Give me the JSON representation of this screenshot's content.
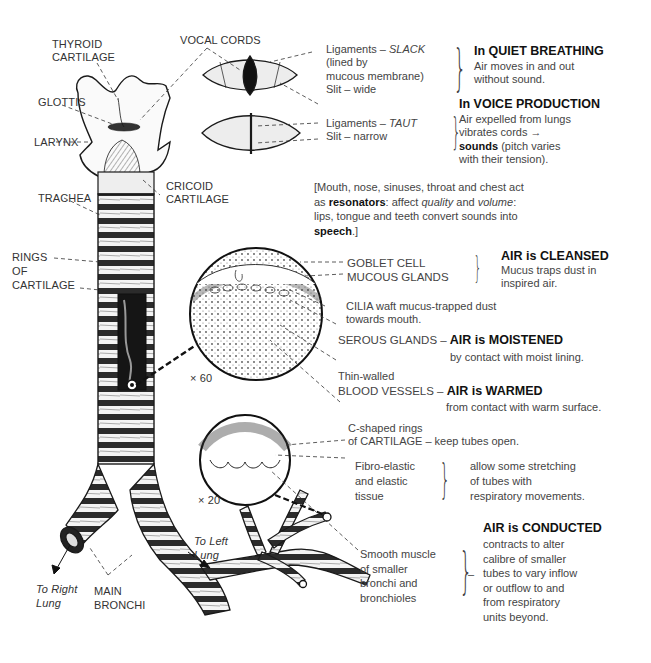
{
  "anatomy_labels": {
    "thyroid_cartilage": [
      "THYROID",
      "CARTILAGE"
    ],
    "vocal_cords": "VOCAL CORDS",
    "glottis": "GLOTTIS",
    "larynx": "LARYNX",
    "cricoid_cartilage": [
      "CRICOID",
      "CARTILAGE"
    ],
    "trachea": "TRACHEA",
    "rings_of_cartilage": [
      "RINGS",
      "OF",
      "CARTILAGE"
    ],
    "main_bronchi": [
      "MAIN",
      "BRONCHI"
    ],
    "to_right_lung": [
      "To Right",
      "Lung"
    ],
    "to_left_lung": [
      "To Left",
      "Lung"
    ],
    "magnification_1": "× 60",
    "magnification_2": "× 20"
  },
  "vocal_cord_states": {
    "slack": {
      "ligaments_prefix": "Ligaments – ",
      "ligaments_state": "SLACK",
      "lined_1": "(lined by",
      "lined_2": "mucous membrane)",
      "slit": "Slit – wide"
    },
    "taut": {
      "ligaments_prefix": "Ligaments – ",
      "ligaments_state": "TAUT",
      "slit": "Slit – narrow"
    }
  },
  "functions": {
    "quiet_breathing": {
      "heading": "In QUIET BREATHING",
      "lines": [
        "Air moves in and out",
        "without sound."
      ]
    },
    "voice_production": {
      "heading": "In VOICE PRODUCTION",
      "lines": [
        "Air expelled from lungs",
        "vibrates cords →"
      ],
      "sounds_bold": "sounds",
      "sounds_rest": " (pitch varies",
      "last": "with their tension)."
    },
    "resonators": {
      "line1": "[Mouth, nose, sinuses, throat and chest act",
      "line2_a": "as ",
      "line2_bold": "resonators",
      "line2_b": ": affect ",
      "line2_it1": "quality",
      "line2_c": " and ",
      "line2_it2": "volume",
      "line2_d": ":",
      "line3": "lips, tongue and teeth convert sounds into",
      "line4_bold": "speech",
      "line4_rest": ".]"
    },
    "cleansed": {
      "structures": [
        "GOBLET CELL",
        "MUCOUS GLANDS"
      ],
      "heading": "AIR is CLEANSED",
      "lines": [
        "Mucus traps dust in",
        "inspired air."
      ],
      "cilia": [
        "CILIA waft mucus-trapped dust",
        "towards mouth."
      ]
    },
    "moistened": {
      "structure": "SEROUS GLANDS – ",
      "heading": "AIR is MOISTENED",
      "line": "by contact with moist lining."
    },
    "warmed": {
      "pre": "Thin-walled",
      "structure": "BLOOD VESSELS – ",
      "heading": "AIR is WARMED",
      "line": "from contact with warm surface."
    },
    "cartilage_rings": {
      "line1": "C-shaped rings",
      "line2": "of CARTILAGE – keep tubes open."
    },
    "elastic": {
      "structure": [
        "Fibro-elastic",
        "and elastic",
        "tissue"
      ],
      "lines": [
        "allow some stretching",
        "of tubes with",
        "respiratory movements."
      ]
    },
    "conducted": {
      "structure": [
        "Smooth muscle",
        "of  smaller",
        "bronchi and",
        "bronchioles"
      ],
      "heading": "AIR is CONDUCTED",
      "lines": [
        "contracts to alter",
        "calibre of smaller",
        "tubes to vary inflow",
        "or outflow to and",
        "from  respiratory",
        "units beyond."
      ]
    }
  },
  "colors": {
    "ink": "#1a1a1a",
    "text": "#3a3a3a",
    "background": "#ffffff"
  }
}
